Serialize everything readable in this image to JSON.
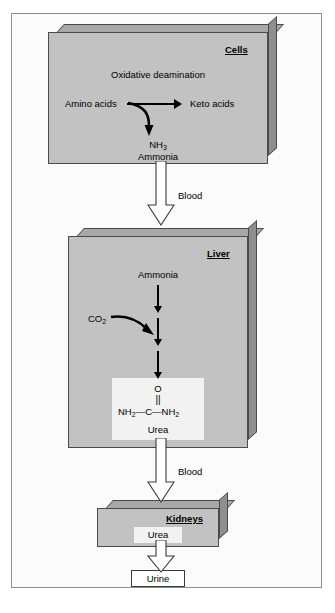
{
  "cells_box": {
    "title": "Cells",
    "process_label": "Oxidative deamination",
    "substrate_label": "Amino acids",
    "product_label": "Keto acids",
    "ammonia_formula": "NH",
    "ammonia_formula_sub": "3",
    "ammonia_name": "Ammonia"
  },
  "liver_box": {
    "title": "Liver",
    "input_label": "Ammonia",
    "co2_label": "CO",
    "co2_sub": "2",
    "urea_oxygen": "O",
    "urea_double_bond": "||",
    "urea_left": "NH",
    "urea_left_sub": "2",
    "urea_dash_left": "—",
    "urea_carbon": "C",
    "urea_dash_right": "—",
    "urea_right": "NH",
    "urea_right_sub": "2",
    "urea_name": "Urea"
  },
  "kidneys_box": {
    "title": "Kidneys",
    "content_label": "Urea"
  },
  "urine_box": {
    "label": "Urine"
  },
  "transport": {
    "blood_upper": "Blood",
    "blood_lower": "Blood"
  },
  "colors": {
    "box_face": "#c2c2c2",
    "box_side": "#8f8f8f",
    "box_top": "#a8a8a8",
    "outline": "#4a4a4a",
    "panel": "#f2f2f2",
    "frame": "#8e8e8e",
    "arrow": "#000000",
    "background": "#ffffff"
  }
}
